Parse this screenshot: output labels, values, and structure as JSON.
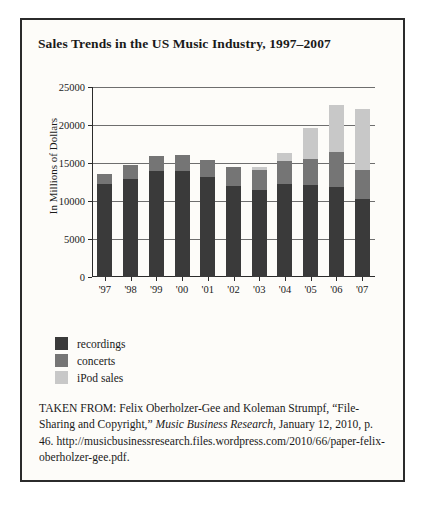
{
  "figure": {
    "title": "Sales Trends in the US Music Industry, 1997–2007",
    "caption": {
      "prefix": "TAKEN FROM: Felix Oberholzer-Gee and Koleman Strumpf, “File-Sharing and Copyright,” ",
      "journal": "Music Business Research",
      "suffix": ", January 12, 2010, p. 46. http://musicbusinessresearch.files.wordpress.com/2010/66/paper-felix-oberholzer-gee.pdf."
    }
  },
  "colors": {
    "recordings": "#3a3a3a",
    "concerts": "#757575",
    "ipod": "#c8c8c8",
    "axis": "#2b2b2b",
    "grid": "#6e6e6e",
    "card_background": "#fdfcf9"
  },
  "chart_data": {
    "type": "bar",
    "stacked": true,
    "title": "Sales Trends in the US Music Industry, 1997–2007",
    "xlabel": "",
    "ylabel": "In Millions of Dollars",
    "ylim": [
      0,
      25000
    ],
    "yticks": [
      0,
      5000,
      10000,
      15000,
      20000,
      25000
    ],
    "ytick_labels": [
      "0",
      "5000",
      "10000",
      "15000",
      "20000",
      "25000"
    ],
    "grid": true,
    "legend_position": "below-left",
    "categories": [
      "'97",
      "'98",
      "'99",
      "'00",
      "'01",
      "'02",
      "'03",
      "'04",
      "'05",
      "'06",
      "'07"
    ],
    "series": [
      {
        "name": "recordings",
        "color": "#3a3a3a",
        "values": [
          12200,
          12900,
          13900,
          13900,
          13200,
          12000,
          11400,
          12200,
          12100,
          11800,
          10200
        ]
      },
      {
        "name": "concerts",
        "color": "#757575",
        "values": [
          1400,
          1900,
          2000,
          2100,
          2200,
          2500,
          2700,
          3000,
          3400,
          4600,
          3900
        ]
      },
      {
        "name": "iPod sales",
        "color": "#c8c8c8",
        "values": [
          0,
          0,
          0,
          0,
          0,
          0,
          400,
          1100,
          4100,
          6300,
          8000
        ]
      }
    ],
    "totals": [
      13600,
      14800,
      15900,
      16000,
      15400,
      14500,
      14500,
      16300,
      19600,
      22700,
      22100
    ]
  },
  "legend": {
    "items": [
      {
        "label": "recordings",
        "color": "#3a3a3a"
      },
      {
        "label": "concerts",
        "color": "#757575"
      },
      {
        "label": "iPod sales",
        "color": "#c8c8c8"
      }
    ]
  }
}
